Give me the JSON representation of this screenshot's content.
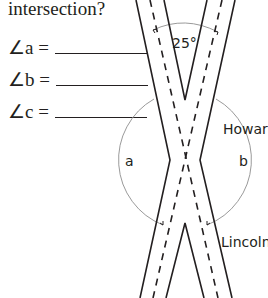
{
  "question": {
    "text": "intersection?"
  },
  "answers": [
    {
      "label": "∠a =",
      "value": ""
    },
    {
      "label": "∠b =",
      "value": ""
    },
    {
      "label": "∠c =",
      "value": ""
    }
  ],
  "diagram": {
    "angle_label": "25°",
    "road_top_label": "Howard",
    "road_bottom_label": "Lincoln",
    "angle_a_label": "a",
    "angle_b_label": "b",
    "line_color": "#231f20",
    "arc_color": "#9a9a9a"
  }
}
